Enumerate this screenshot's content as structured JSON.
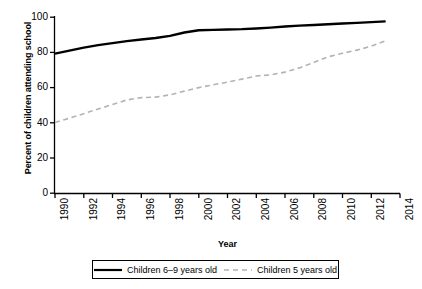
{
  "chart_data": {
    "type": "line",
    "title": "",
    "xlabel": "Year",
    "ylabel": "Percent of children attending school",
    "xlim": [
      1990,
      2014
    ],
    "ylim": [
      0,
      100
    ],
    "grid": false,
    "legend_position": "bottom-center",
    "xticks": [
      "1990",
      "1992",
      "1994",
      "1996",
      "1998",
      "2000",
      "2002",
      "2004",
      "2006",
      "2008",
      "2010",
      "2012",
      "2014"
    ],
    "xtick_values": [
      1990,
      1992,
      1994,
      1996,
      1998,
      2000,
      2002,
      2004,
      2006,
      2008,
      2010,
      2012,
      2014
    ],
    "yticks": [
      "0",
      "20",
      "40",
      "60",
      "80",
      "100"
    ],
    "ytick_values": [
      0,
      20,
      40,
      60,
      80,
      100
    ],
    "x": [
      1990,
      1991,
      1992,
      1993,
      1994,
      1995,
      1996,
      1997,
      1998,
      1999,
      2000,
      2001,
      2002,
      2003,
      2004,
      2005,
      2006,
      2007,
      2008,
      2009,
      2010,
      2011,
      2012,
      2013
    ],
    "series": [
      {
        "name": "Children 6–9 years old",
        "style": "solid",
        "color": "#000000",
        "values": [
          79.3,
          81.0,
          82.7,
          84.1,
          85.3,
          86.4,
          87.3,
          88.2,
          89.4,
          91.3,
          92.6,
          92.8,
          93.0,
          93.2,
          93.6,
          94.1,
          94.7,
          95.2,
          95.6,
          96.0,
          96.4,
          96.8,
          97.2,
          97.6
        ]
      },
      {
        "name": "Children 5 years old",
        "style": "dashed",
        "color": "#b3b3b3",
        "values": [
          40.2,
          42.6,
          45.2,
          47.8,
          50.4,
          53.0,
          54.3,
          54.6,
          55.9,
          58.0,
          60.0,
          61.6,
          63.1,
          64.8,
          66.6,
          67.2,
          68.8,
          71.2,
          74.3,
          77.5,
          79.5,
          81.3,
          83.5,
          86.6
        ]
      }
    ]
  },
  "legend": {
    "entries": [
      {
        "label": "Children 6–9 years old",
        "style": "solid"
      },
      {
        "label": "Children 5 years old",
        "style": "dashed"
      }
    ]
  }
}
